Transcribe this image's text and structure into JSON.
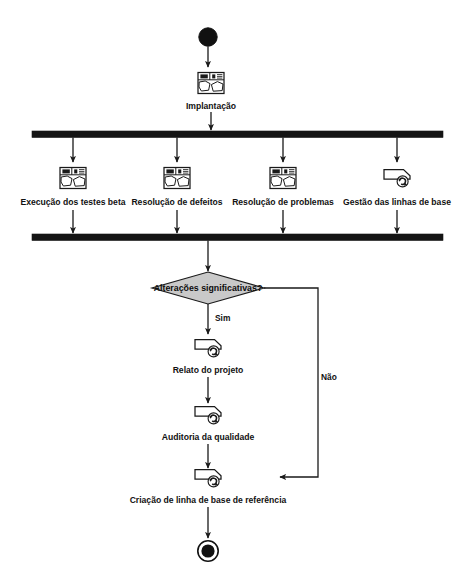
{
  "diagram": {
    "title": "Implantação",
    "language": "pt",
    "type": "uml-activity-diagram",
    "colors": {
      "line": "#1a1a1a",
      "bar": "#141414",
      "decision_fill": "#c9c9c9",
      "background": "#ffffff",
      "text": "#111111"
    },
    "start_node": {
      "name": "initial-node"
    },
    "end_node": {
      "name": "final-node"
    },
    "initial_activity": {
      "label": "Implantação",
      "icon": "package-process-icon"
    },
    "fork": {
      "label": "",
      "name": "fork-bar"
    },
    "parallel_activities": [
      {
        "label": "Execução dos testes beta",
        "icon": "package-process-icon"
      },
      {
        "label": "Resolução de defeitos",
        "icon": "package-process-icon"
      },
      {
        "label": "Resolução de problemas",
        "icon": "package-process-icon"
      },
      {
        "label": "Gestão das linhas de base",
        "icon": "cycle-process-icon"
      }
    ],
    "join": {
      "label": "",
      "name": "join-bar"
    },
    "decision": {
      "label": "Alterações significativas?",
      "text": "Alterações significativas",
      "guard_yes": "Sim",
      "guard_no": "Não"
    },
    "sequential_activities": [
      {
        "label": "Relato do projeto",
        "icon": "cycle-process-icon"
      },
      {
        "label": "Auditoria da qualidade",
        "icon": "cycle-process-icon"
      },
      {
        "label": "Criação de linha de base de referência",
        "icon": "cycle-process-icon"
      }
    ]
  }
}
